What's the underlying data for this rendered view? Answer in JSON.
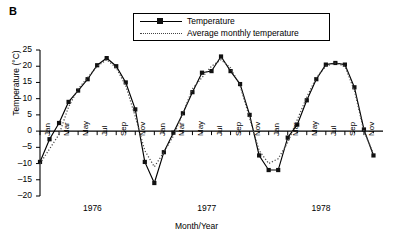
{
  "panel": {
    "label": "B"
  },
  "legend": {
    "position": "top-center",
    "entries": [
      {
        "label": "Temperature",
        "style": "solid-line-with-square-markers",
        "color": "#000000"
      },
      {
        "label": "Average monthly temperature",
        "style": "dotted-line",
        "color": "#444444"
      }
    ]
  },
  "chart_data": {
    "type": "line",
    "title": "",
    "xlabel": "Month/Year",
    "ylabel": "Temperature (°C)",
    "ylim": [
      -20,
      25
    ],
    "yticks": [
      25,
      20,
      15,
      10,
      5,
      0,
      -5,
      -10,
      -15,
      -20
    ],
    "ytick_labels": [
      "25",
      "20",
      "15",
      "10",
      "5",
      "0",
      "–5",
      "–10",
      "–15",
      "–20"
    ],
    "grid": false,
    "xlim": [
      0,
      36
    ],
    "x_tick_labels": [
      "Jan",
      "Mar",
      "May",
      "Jul",
      "Sep",
      "Nov",
      "Jan",
      "Mar",
      "May",
      "Jul",
      "Sep",
      "Nov",
      "Jan",
      "Mar",
      "May",
      "Jul",
      "Sep",
      "Nov"
    ],
    "x_tick_positions": [
      0,
      2,
      4,
      6,
      8,
      10,
      12,
      14,
      16,
      18,
      20,
      22,
      24,
      26,
      28,
      30,
      32,
      34
    ],
    "x_minor_positions": [
      1,
      3,
      5,
      7,
      9,
      11,
      13,
      15,
      17,
      19,
      21,
      23,
      25,
      27,
      29,
      31,
      33,
      35
    ],
    "year_labels": [
      {
        "text": "1976",
        "x": 5.5
      },
      {
        "text": "1977",
        "x": 17.5
      },
      {
        "text": "1978",
        "x": 29.5
      }
    ],
    "months": [
      "Jan",
      "Feb",
      "Mar",
      "Apr",
      "May",
      "Jun",
      "Jul",
      "Aug",
      "Sep",
      "Oct",
      "Nov",
      "Dec",
      "Jan",
      "Feb",
      "Mar",
      "Apr",
      "May",
      "Jun",
      "Jul",
      "Aug",
      "Sep",
      "Oct",
      "Nov",
      "Dec",
      "Jan",
      "Feb",
      "Mar",
      "Apr",
      "May",
      "Jun",
      "Jul",
      "Aug",
      "Sep",
      "Oct",
      "Nov",
      "Dec"
    ],
    "series": [
      {
        "name": "Temperature",
        "style": "solid",
        "marker": "square",
        "x": [
          0,
          1,
          2,
          3,
          4,
          5,
          6,
          7,
          8,
          9,
          10,
          11,
          12,
          13,
          14,
          15,
          16,
          17,
          18,
          19,
          20,
          21,
          22,
          23,
          24,
          25,
          26,
          27,
          28,
          29,
          30,
          31,
          32,
          33,
          34,
          35
        ],
        "values": [
          -9.5,
          -2.5,
          2.5,
          9.0,
          12.5,
          16.0,
          20.3,
          22.5,
          20.0,
          15.0,
          6.7,
          -9.5,
          -16.0,
          -6.5,
          -0.5,
          5.5,
          12.0,
          18.0,
          18.5,
          23.0,
          18.5,
          14.5,
          5.0,
          -7.5,
          -12.0,
          -12.0,
          -2.0,
          2.0,
          9.5,
          16.0,
          20.5,
          21.0,
          20.5,
          13.5,
          0.5,
          -7.5
        ]
      },
      {
        "name": "Average monthly temperature",
        "style": "dotted",
        "marker": "none",
        "x": [
          0,
          1,
          2,
          3,
          4,
          5,
          6,
          7,
          8,
          9,
          10,
          11,
          12,
          13,
          14,
          15,
          16,
          17,
          18,
          19,
          20,
          21,
          22,
          23,
          24,
          25,
          26,
          27,
          28,
          29,
          30,
          31,
          32,
          33,
          34,
          35
        ],
        "values": [
          -10.0,
          -5.5,
          -1.0,
          7.5,
          13.0,
          16.5,
          20.0,
          22.0,
          19.5,
          14.0,
          4.5,
          -6.0,
          -11.0,
          -6.5,
          -1.5,
          5.5,
          13.0,
          16.5,
          20.0,
          22.0,
          19.5,
          14.0,
          4.0,
          -6.0,
          -10.0,
          -8.5,
          -3.5,
          3.5,
          10.5,
          16.5,
          20.0,
          21.0,
          20.0,
          12.5,
          0.0,
          -7.0
        ]
      }
    ]
  }
}
